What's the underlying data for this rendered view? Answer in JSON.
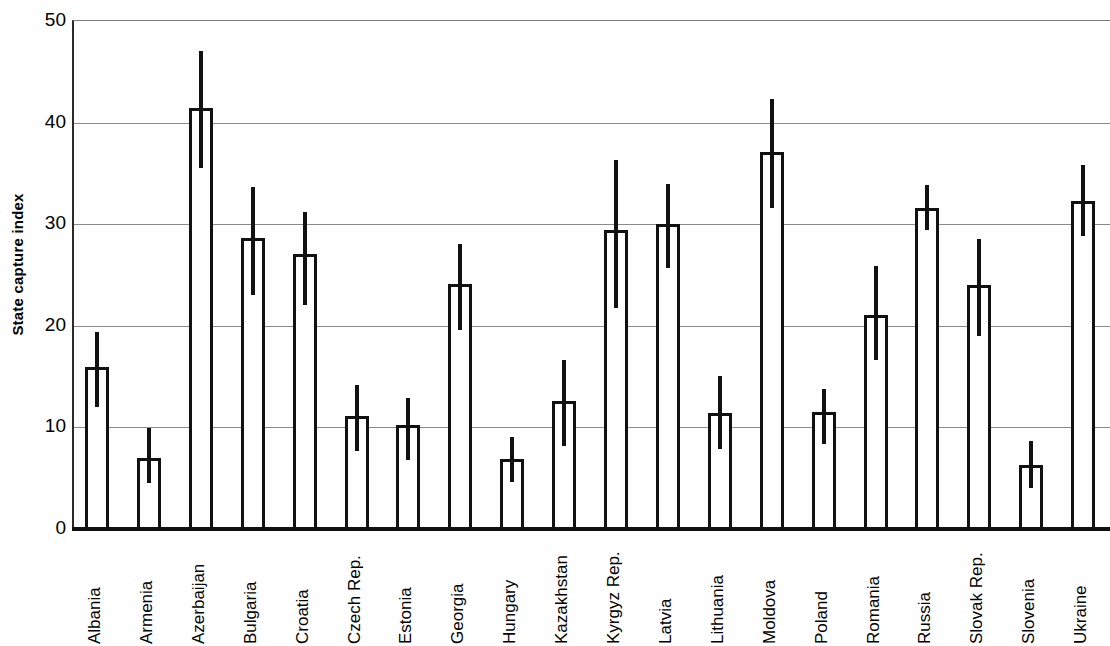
{
  "chart_data": {
    "type": "bar",
    "title": "",
    "subtitle": "",
    "xlabel": "",
    "ylabel": "State capture index",
    "ylim": [
      0,
      50
    ],
    "yticks": [
      0,
      10,
      20,
      30,
      40,
      50
    ],
    "ytick_labels": [
      "0",
      "10",
      "20",
      "30",
      "40",
      "50"
    ],
    "grid": true,
    "legend": "none",
    "orientation": "vertical",
    "error_bars": "vertical line through bar top (no caps)",
    "categories": [
      "Albania",
      "Armenia",
      "Azerbaijan",
      "Bulgaria",
      "Croatia",
      "Czech Rep.",
      "Estonia",
      "Georgia",
      "Hungary",
      "Kazakhstan",
      "Kyrgyz Rep.",
      "Latvia",
      "Lithuania",
      "Moldova",
      "Poland",
      "Romania",
      "Russia",
      "Slovak Rep.",
      "Slovenia",
      "Ukraine"
    ],
    "values": [
      15.9,
      7.0,
      41.4,
      28.6,
      27.1,
      11.1,
      10.2,
      24.1,
      6.9,
      12.6,
      29.4,
      30.0,
      11.4,
      37.1,
      11.5,
      21.1,
      31.6,
      24.0,
      6.3,
      32.3
    ],
    "error_low": [
      12.0,
      4.5,
      35.5,
      23.0,
      22.0,
      7.7,
      6.8,
      19.6,
      4.6,
      8.2,
      21.8,
      25.7,
      7.9,
      31.6,
      8.4,
      16.6,
      29.4,
      19.0,
      4.0,
      28.8
    ],
    "error_high": [
      19.4,
      9.9,
      47.0,
      33.7,
      31.2,
      14.2,
      12.9,
      28.1,
      9.1,
      16.6,
      36.3,
      34.0,
      15.1,
      42.3,
      13.8,
      25.9,
      33.9,
      28.5,
      8.7,
      35.8
    ]
  },
  "axis": {
    "y_title": "State capture index"
  }
}
